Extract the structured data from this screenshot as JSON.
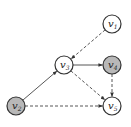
{
  "diagram": {
    "nodes": [
      {
        "id": "v1",
        "label": "v",
        "sub": "1",
        "x": 112,
        "y": 24,
        "shaded": false
      },
      {
        "id": "v2",
        "label": "v",
        "sub": "2",
        "x": 16,
        "y": 106,
        "shaded": true
      },
      {
        "id": "v3",
        "label": "v",
        "sub": "3",
        "x": 64,
        "y": 65,
        "shaded": false
      },
      {
        "id": "v4",
        "label": "v",
        "sub": "4",
        "x": 112,
        "y": 65,
        "shaded": true
      },
      {
        "id": "v5",
        "label": "v",
        "sub": "5",
        "x": 112,
        "y": 106,
        "shaded": false
      }
    ],
    "edges": [
      {
        "from": "v1",
        "to": "v3",
        "style": "dashed"
      },
      {
        "from": "v2",
        "to": "v3",
        "style": "solid"
      },
      {
        "from": "v3",
        "to": "v4",
        "style": "solid"
      },
      {
        "from": "v3",
        "to": "v5",
        "style": "dashed"
      },
      {
        "from": "v4",
        "to": "v5",
        "style": "dashed"
      },
      {
        "from": "v2",
        "to": "v5",
        "style": "dashed"
      }
    ],
    "colors": {
      "shaded": "#b8b8b8",
      "plain": "#ffffff",
      "stroke": "#333333"
    }
  }
}
